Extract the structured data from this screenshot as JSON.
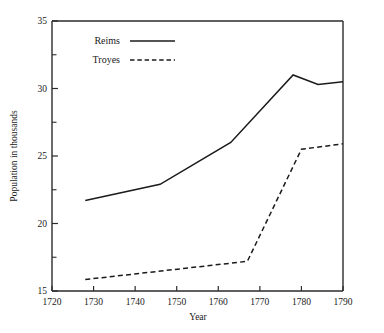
{
  "chart_data": {
    "type": "line",
    "title": "",
    "xlabel": "Year",
    "ylabel": "Population in thousands",
    "xlim": [
      1720,
      1790
    ],
    "ylim": [
      15,
      35
    ],
    "grid": false,
    "legend_position": "top-left",
    "xticks": [
      1720,
      1730,
      1740,
      1750,
      1760,
      1770,
      1780,
      1790
    ],
    "xtick_labels": [
      "1720",
      "1730",
      "1740",
      "1750",
      "1760",
      "1770",
      "1780",
      "1790"
    ],
    "yticks": [
      15,
      20,
      25,
      30,
      35
    ],
    "ytick_labels": [
      "15",
      "20",
      "25",
      "30",
      "35"
    ],
    "yticks_minor": [
      17.5,
      22.5,
      27.5,
      32.5
    ],
    "series": [
      {
        "name": "Reims",
        "style": "solid",
        "color": "#1b1b1b",
        "x": [
          1728,
          1746,
          1763,
          1778,
          1784,
          1790
        ],
        "values": [
          21.7,
          22.9,
          26.0,
          31.0,
          30.3,
          30.5
        ]
      },
      {
        "name": "Troyes",
        "style": "dashed",
        "color": "#1b1b1b",
        "x": [
          1728,
          1767,
          1780,
          1790
        ],
        "values": [
          15.85,
          17.2,
          25.5,
          25.9
        ]
      }
    ]
  },
  "legend": {
    "entries": [
      {
        "label": "Reims"
      },
      {
        "label": "Troyes"
      }
    ]
  },
  "axes": {
    "x_title": "Year",
    "y_title": "Population in thousands"
  }
}
